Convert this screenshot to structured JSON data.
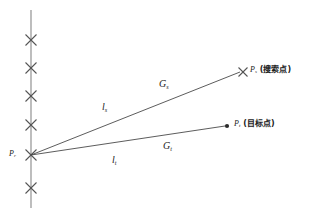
{
  "figure": {
    "title": "",
    "background_color": "#ffffff",
    "line_color": "#555555",
    "marker_color": "#555555",
    "text_color": "#222222"
  },
  "axis": {
    "name": "vertical-reference-line",
    "x": 31,
    "y_top": 10,
    "y_bottom": 208,
    "markers_y": [
      40,
      68,
      96,
      125,
      155,
      188
    ],
    "marker_glyph": "cross"
  },
  "points": {
    "origin": {
      "label": "P",
      "subscript": "r",
      "x": 31,
      "y": 155,
      "marker": "cross"
    },
    "search": {
      "label": "P",
      "subscript": "s",
      "annotation": "(搜索点)",
      "x": 243,
      "y": 72,
      "marker": "cross"
    },
    "target": {
      "label": "P",
      "subscript": "t",
      "annotation": "(目标点)",
      "x": 227,
      "y": 126,
      "marker": "dot"
    }
  },
  "rays": [
    {
      "name": "search-ray",
      "from": "origin",
      "to": "search",
      "near_label": "l",
      "near_subscript": "s",
      "far_label": "G",
      "far_subscript": "s"
    },
    {
      "name": "target-ray",
      "from": "origin",
      "to": "target",
      "near_label": "l",
      "near_subscript": "t",
      "far_label": "G",
      "far_subscript": "t"
    }
  ],
  "labels": {
    "l_s": {
      "base": "l",
      "sub": "s"
    },
    "l_t": {
      "base": "l",
      "sub": "t"
    },
    "G_s": {
      "base": "G",
      "sub": "s"
    },
    "G_t": {
      "base": "G",
      "sub": "t"
    },
    "P_r": {
      "base": "P",
      "sub": "r"
    },
    "P_s": {
      "base": "P",
      "sub": "s",
      "cjk": "(搜索点)"
    },
    "P_t": {
      "base": "P",
      "sub": "t",
      "cjk": "(目标点)"
    }
  }
}
